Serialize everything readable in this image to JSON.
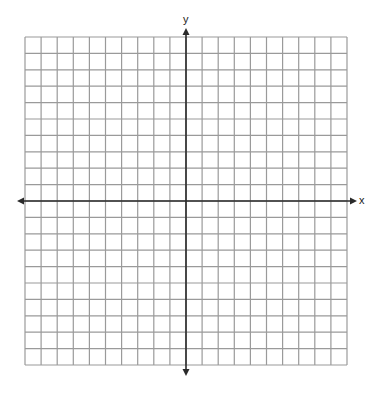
{
  "diagram": {
    "type": "coordinate-plane",
    "grid": {
      "columns": 20,
      "rows": 20,
      "left": 25,
      "top": 37,
      "right": 347,
      "bottom": 365,
      "line_color": "#9a9a9a",
      "line_width": 1.2
    },
    "axes": {
      "color": "#2a2a2a",
      "x_axis": {
        "label": "x",
        "y": 201,
        "from": 17,
        "to": 357
      },
      "y_axis": {
        "label": "y",
        "x": 186,
        "from": 28,
        "to": 376
      }
    }
  }
}
